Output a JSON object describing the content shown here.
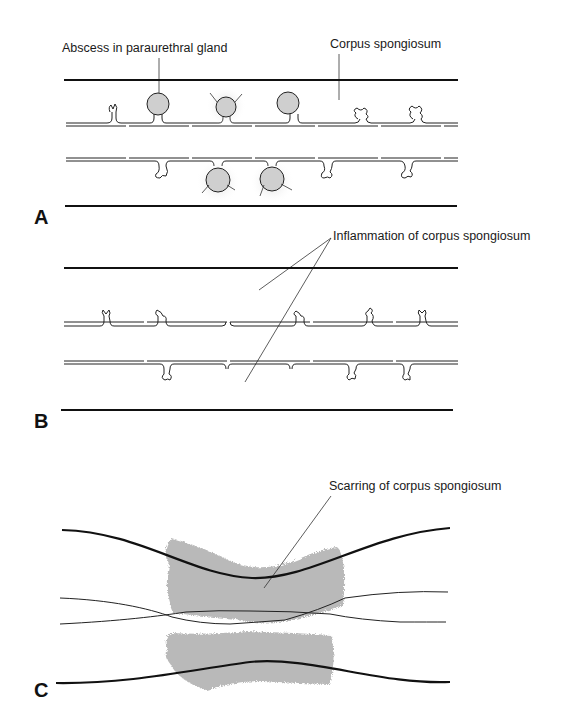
{
  "figure": {
    "panels": [
      {
        "id": "A",
        "label": "A",
        "annotations": [
          {
            "text": "Abscess in paraurethral gland"
          },
          {
            "text": "Corpus spongiosum"
          }
        ]
      },
      {
        "id": "B",
        "label": "B",
        "annotations": [
          {
            "text": "Inflammation of corpus spongiosum"
          }
        ]
      },
      {
        "id": "C",
        "label": "C",
        "annotations": [
          {
            "text": "Scarring of corpus spongiosum"
          }
        ]
      }
    ]
  }
}
